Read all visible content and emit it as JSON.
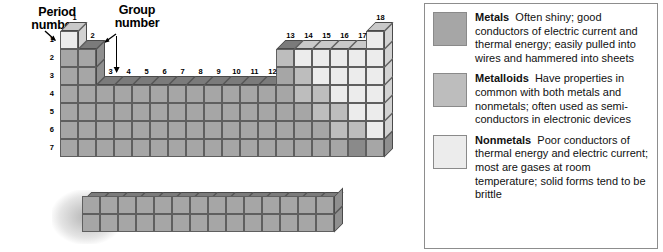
{
  "diagram": {
    "period_axis_label": "Period\nnumber",
    "period_label_line1": "Period",
    "period_label_line2": "number",
    "group_label_line1": "Group",
    "group_label_line2": "number",
    "period_numbers": [
      "1",
      "2",
      "3",
      "4",
      "5",
      "6",
      "7"
    ],
    "group_numbers": [
      "1",
      "2",
      "3",
      "4",
      "5",
      "6",
      "7",
      "8",
      "9",
      "10",
      "11",
      "12",
      "13",
      "14",
      "15",
      "16",
      "17",
      "18"
    ],
    "categories": {
      "metal": "#a6a6a6",
      "metalloid": "#bdbdbd",
      "nonmetal": "#ececec"
    },
    "f_block": {
      "rows": 2,
      "columns": 14,
      "category": "metal"
    }
  },
  "legend": {
    "items": [
      {
        "swatch": "metal",
        "term": "Metals",
        "description": "Often shiny; good conductors of electric current and thermal energy; easily pulled into wires and hammered into sheets"
      },
      {
        "swatch": "metalloid",
        "term": "Metalloids",
        "description": "Have properties in common with both metals and nonmetals; often used as semi-conductors in electronic devices"
      },
      {
        "swatch": "nonmetal",
        "term": "Nonmetals",
        "description": "Poor conductors of thermal energy and electric current; most are gases at room temperature; solid forms tend to be brittle"
      }
    ]
  },
  "chart_data": {
    "type": "table",
    "xlabel": "Group number",
    "ylabel": "Period number",
    "categories": [
      "1",
      "2",
      "3",
      "4",
      "5",
      "6",
      "7",
      "8",
      "9",
      "10",
      "11",
      "12",
      "13",
      "14",
      "15",
      "16",
      "17",
      "18"
    ],
    "rows": [
      "1",
      "2",
      "3",
      "4",
      "5",
      "6",
      "7"
    ],
    "legend_position": "right",
    "grid": true,
    "cells": [
      {
        "period": 1,
        "group": 1,
        "class": "nonmetal"
      },
      {
        "period": 1,
        "group": 18,
        "class": "nonmetal"
      },
      {
        "period": 2,
        "group": 1,
        "class": "metal"
      },
      {
        "period": 2,
        "group": 2,
        "class": "metal"
      },
      {
        "period": 2,
        "group": 13,
        "class": "metalloid"
      },
      {
        "period": 2,
        "group": 14,
        "class": "nonmetal"
      },
      {
        "period": 2,
        "group": 15,
        "class": "nonmetal"
      },
      {
        "period": 2,
        "group": 16,
        "class": "nonmetal"
      },
      {
        "period": 2,
        "group": 17,
        "class": "nonmetal"
      },
      {
        "period": 2,
        "group": 18,
        "class": "nonmetal"
      },
      {
        "period": 3,
        "group": 1,
        "class": "metal"
      },
      {
        "period": 3,
        "group": 2,
        "class": "metal"
      },
      {
        "period": 3,
        "group": 13,
        "class": "metal"
      },
      {
        "period": 3,
        "group": 14,
        "class": "metalloid"
      },
      {
        "period": 3,
        "group": 15,
        "class": "nonmetal"
      },
      {
        "period": 3,
        "group": 16,
        "class": "nonmetal"
      },
      {
        "period": 3,
        "group": 17,
        "class": "nonmetal"
      },
      {
        "period": 3,
        "group": 18,
        "class": "nonmetal"
      },
      {
        "period": 4,
        "group": 1,
        "class": "metal"
      },
      {
        "period": 4,
        "group": 2,
        "class": "metal"
      },
      {
        "period": 4,
        "group": 3,
        "class": "metal"
      },
      {
        "period": 4,
        "group": 4,
        "class": "metal"
      },
      {
        "period": 4,
        "group": 5,
        "class": "metal"
      },
      {
        "period": 4,
        "group": 6,
        "class": "metal"
      },
      {
        "period": 4,
        "group": 7,
        "class": "metal"
      },
      {
        "period": 4,
        "group": 8,
        "class": "metal"
      },
      {
        "period": 4,
        "group": 9,
        "class": "metal"
      },
      {
        "period": 4,
        "group": 10,
        "class": "metal"
      },
      {
        "period": 4,
        "group": 11,
        "class": "metal"
      },
      {
        "period": 4,
        "group": 12,
        "class": "metal"
      },
      {
        "period": 4,
        "group": 13,
        "class": "metal"
      },
      {
        "period": 4,
        "group": 14,
        "class": "metalloid"
      },
      {
        "period": 4,
        "group": 15,
        "class": "metalloid"
      },
      {
        "period": 4,
        "group": 16,
        "class": "nonmetal"
      },
      {
        "period": 4,
        "group": 17,
        "class": "nonmetal"
      },
      {
        "period": 4,
        "group": 18,
        "class": "nonmetal"
      },
      {
        "period": 5,
        "group": 1,
        "class": "metal"
      },
      {
        "period": 5,
        "group": 2,
        "class": "metal"
      },
      {
        "period": 5,
        "group": 3,
        "class": "metal"
      },
      {
        "period": 5,
        "group": 4,
        "class": "metal"
      },
      {
        "period": 5,
        "group": 5,
        "class": "metal"
      },
      {
        "period": 5,
        "group": 6,
        "class": "metal"
      },
      {
        "period": 5,
        "group": 7,
        "class": "metal"
      },
      {
        "period": 5,
        "group": 8,
        "class": "metal"
      },
      {
        "period": 5,
        "group": 9,
        "class": "metal"
      },
      {
        "period": 5,
        "group": 10,
        "class": "metal"
      },
      {
        "period": 5,
        "group": 11,
        "class": "metal"
      },
      {
        "period": 5,
        "group": 12,
        "class": "metal"
      },
      {
        "period": 5,
        "group": 13,
        "class": "metal"
      },
      {
        "period": 5,
        "group": 14,
        "class": "metal"
      },
      {
        "period": 5,
        "group": 15,
        "class": "metalloid"
      },
      {
        "period": 5,
        "group": 16,
        "class": "metalloid"
      },
      {
        "period": 5,
        "group": 17,
        "class": "nonmetal"
      },
      {
        "period": 5,
        "group": 18,
        "class": "nonmetal"
      },
      {
        "period": 6,
        "group": 1,
        "class": "metal"
      },
      {
        "period": 6,
        "group": 2,
        "class": "metal"
      },
      {
        "period": 6,
        "group": 3,
        "class": "metal"
      },
      {
        "period": 6,
        "group": 4,
        "class": "metal"
      },
      {
        "period": 6,
        "group": 5,
        "class": "metal"
      },
      {
        "period": 6,
        "group": 6,
        "class": "metal"
      },
      {
        "period": 6,
        "group": 7,
        "class": "metal"
      },
      {
        "period": 6,
        "group": 8,
        "class": "metal"
      },
      {
        "period": 6,
        "group": 9,
        "class": "metal"
      },
      {
        "period": 6,
        "group": 10,
        "class": "metal"
      },
      {
        "period": 6,
        "group": 11,
        "class": "metal"
      },
      {
        "period": 6,
        "group": 12,
        "class": "metal"
      },
      {
        "period": 6,
        "group": 13,
        "class": "metal"
      },
      {
        "period": 6,
        "group": 14,
        "class": "metal"
      },
      {
        "period": 6,
        "group": 15,
        "class": "metal"
      },
      {
        "period": 6,
        "group": 16,
        "class": "metalloid"
      },
      {
        "period": 6,
        "group": 17,
        "class": "metalloid"
      },
      {
        "period": 6,
        "group": 18,
        "class": "nonmetal"
      },
      {
        "period": 7,
        "group": 1,
        "class": "metal"
      },
      {
        "period": 7,
        "group": 2,
        "class": "metal"
      },
      {
        "period": 7,
        "group": 3,
        "class": "metal"
      },
      {
        "period": 7,
        "group": 4,
        "class": "metal"
      },
      {
        "period": 7,
        "group": 5,
        "class": "metal"
      },
      {
        "period": 7,
        "group": 6,
        "class": "metal"
      },
      {
        "period": 7,
        "group": 7,
        "class": "metal"
      },
      {
        "period": 7,
        "group": 8,
        "class": "metal"
      },
      {
        "period": 7,
        "group": 9,
        "class": "metal"
      },
      {
        "period": 7,
        "group": 10,
        "class": "metal"
      },
      {
        "period": 7,
        "group": 11,
        "class": "metal"
      },
      {
        "period": 7,
        "group": 12,
        "class": "metal"
      },
      {
        "period": 7,
        "group": 13,
        "class": "metal"
      },
      {
        "period": 7,
        "group": 14,
        "class": "metal"
      },
      {
        "period": 7,
        "group": 15,
        "class": "metal"
      },
      {
        "period": 7,
        "group": 16,
        "class": "metal"
      },
      {
        "period": 7,
        "group": 17,
        "class": "dark"
      },
      {
        "period": 7,
        "group": 18,
        "class": "metal"
      }
    ]
  }
}
